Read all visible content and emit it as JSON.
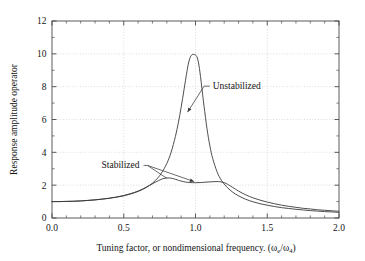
{
  "chart_data": {
    "type": "line",
    "title": "",
    "xlabel": "Tuning factor, or nondimensional frequency. (ωe/ω4)",
    "xlabel_parts": {
      "main": "Tuning factor, or nondimensional frequency. (",
      "omega1": "ω",
      "sub1": "e",
      "slash": "/",
      "omega2": "ω",
      "sub2": "4",
      "close": ")"
    },
    "ylabel": "Response amplitude operator",
    "xlim": [
      0.0,
      2.0
    ],
    "ylim": [
      0,
      12
    ],
    "xticks": [
      0.0,
      0.5,
      1.0,
      1.5,
      2.0
    ],
    "xticklabels": [
      "0.0",
      "0.5",
      "1.0",
      "1.5",
      "2.0"
    ],
    "yticks": [
      0,
      2,
      4,
      6,
      8,
      10,
      12
    ],
    "yticklabels": [
      "0",
      "2",
      "4",
      "6",
      "8",
      "10",
      "12"
    ],
    "x_minor_step": 0.1,
    "y_minor_step": 1,
    "grid": true,
    "grid_style": "dotted",
    "grid_color": "#c9c9c9",
    "legend": "none",
    "line_color": "#3a3a3a",
    "frame_color": "#4a4a4a",
    "annotations": [
      {
        "text": "Unstabilized",
        "text_x": 1.12,
        "text_y": 7.85,
        "point_x": 0.945,
        "point_y": 6.45,
        "elbow_x": 1.06,
        "elbow_y": 7.85
      },
      {
        "text": "Stabilized",
        "text_x": 0.345,
        "text_y": 3.02,
        "point_x": 0.99,
        "point_y": 2.22,
        "point2_x": 0.8,
        "point2_y": 2.42,
        "elbow_x": 0.665,
        "elbow_y": 3.02
      }
    ],
    "series": [
      {
        "name": "Unstabilized",
        "x": [
          0.0,
          0.05,
          0.1,
          0.15,
          0.2,
          0.25,
          0.3,
          0.35,
          0.4,
          0.45,
          0.5,
          0.55,
          0.6,
          0.64,
          0.68,
          0.72,
          0.76,
          0.8,
          0.83,
          0.86,
          0.88,
          0.9,
          0.92,
          0.94,
          0.95,
          0.96,
          0.97,
          0.98,
          0.99,
          1.0,
          1.01,
          1.02,
          1.03,
          1.04,
          1.05,
          1.06,
          1.08,
          1.1,
          1.12,
          1.15,
          1.18,
          1.22,
          1.26,
          1.3,
          1.35,
          1.4,
          1.45,
          1.5,
          1.55,
          1.6,
          1.65,
          1.7,
          1.75,
          1.8,
          1.85,
          1.9,
          1.95,
          2.0
        ],
        "y": [
          1.0,
          1.0,
          1.01,
          1.02,
          1.04,
          1.07,
          1.1,
          1.15,
          1.2,
          1.27,
          1.35,
          1.47,
          1.62,
          1.78,
          1.99,
          2.28,
          2.7,
          3.32,
          4.0,
          4.97,
          5.78,
          6.74,
          7.82,
          8.9,
          9.38,
          9.71,
          9.9,
          9.96,
          9.96,
          9.93,
          9.82,
          9.5,
          8.95,
          8.25,
          7.5,
          6.78,
          5.45,
          4.4,
          3.62,
          2.82,
          2.3,
          1.87,
          1.57,
          1.35,
          1.14,
          0.99,
          0.87,
          0.78,
          0.7,
          0.63,
          0.58,
          0.53,
          0.49,
          0.45,
          0.42,
          0.39,
          0.37,
          0.34
        ]
      },
      {
        "name": "Stabilized",
        "x": [
          0.0,
          0.05,
          0.1,
          0.15,
          0.2,
          0.25,
          0.3,
          0.35,
          0.4,
          0.45,
          0.5,
          0.55,
          0.6,
          0.64,
          0.68,
          0.72,
          0.76,
          0.78,
          0.8,
          0.82,
          0.84,
          0.86,
          0.88,
          0.9,
          0.93,
          0.96,
          1.0,
          1.04,
          1.08,
          1.12,
          1.15,
          1.17,
          1.19,
          1.21,
          1.23,
          1.26,
          1.3,
          1.35,
          1.4,
          1.45,
          1.5,
          1.55,
          1.6,
          1.65,
          1.7,
          1.75,
          1.8,
          1.85,
          1.9,
          1.95,
          2.0
        ],
        "y": [
          1.0,
          1.0,
          1.01,
          1.02,
          1.04,
          1.07,
          1.11,
          1.15,
          1.21,
          1.28,
          1.37,
          1.49,
          1.64,
          1.8,
          1.99,
          2.18,
          2.35,
          2.41,
          2.44,
          2.44,
          2.41,
          2.36,
          2.3,
          2.25,
          2.19,
          2.16,
          2.15,
          2.16,
          2.19,
          2.21,
          2.22,
          2.21,
          2.18,
          2.12,
          2.02,
          1.86,
          1.64,
          1.41,
          1.23,
          1.09,
          0.97,
          0.87,
          0.78,
          0.71,
          0.65,
          0.59,
          0.55,
          0.5,
          0.47,
          0.44,
          0.41
        ]
      }
    ]
  }
}
